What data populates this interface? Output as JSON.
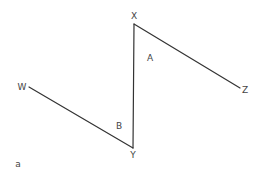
{
  "diagram": {
    "caption": "a",
    "stroke_color": "#333333",
    "points": {
      "W": {
        "label": "W",
        "x": 29,
        "y": 87
      },
      "Y": {
        "label": "Y",
        "x": 133,
        "y": 148
      },
      "X": {
        "label": "X",
        "x": 134,
        "y": 24
      },
      "Z": {
        "label": "Z",
        "x": 240,
        "y": 88
      }
    },
    "angles": {
      "A": {
        "label": "A",
        "at": "X"
      },
      "B": {
        "label": "B",
        "at": "Y"
      }
    },
    "segments": [
      {
        "from": "W",
        "to": "Y"
      },
      {
        "from": "Y",
        "to": "X"
      },
      {
        "from": "X",
        "to": "Z"
      }
    ]
  }
}
